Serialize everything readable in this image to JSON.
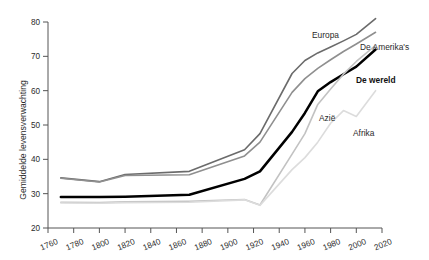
{
  "chart_data": {
    "type": "line",
    "title": "",
    "subtitle": "",
    "xlabel": "",
    "ylabel": "Gemiddelde levensverwachting",
    "xlim": [
      1760,
      2020
    ],
    "ylim": [
      20,
      80
    ],
    "xticks": [
      1760,
      1780,
      1800,
      1820,
      1840,
      1860,
      1880,
      1900,
      1920,
      1940,
      1960,
      1980,
      2000,
      2020
    ],
    "yticks": [
      20,
      30,
      40,
      50,
      60,
      70,
      80
    ],
    "grid": false,
    "legend_position": "inline-end-of-line",
    "x": [
      1770,
      1800,
      1820,
      1870,
      1913,
      1925,
      1950,
      1960,
      1970,
      1980,
      1990,
      2000,
      2015
    ],
    "series": [
      {
        "name": "Europa",
        "label": "Europa",
        "color": "#6b6b6b",
        "width": 1.6,
        "values": [
          34.6,
          33.5,
          35.6,
          36.5,
          42.8,
          47.5,
          65.0,
          68.8,
          71.0,
          72.7,
          74.5,
          76.4,
          81.0
        ]
      },
      {
        "name": "De Amerika's",
        "label": "De Amerika's",
        "color": "#8f8f8f",
        "width": 1.6,
        "values": [
          34.5,
          33.4,
          35.3,
          35.5,
          41.0,
          45.0,
          59.5,
          63.5,
          66.5,
          69.0,
          71.4,
          73.6,
          77.0
        ]
      },
      {
        "name": "De wereld",
        "label": "De wereld",
        "color": "#000000",
        "width": 2.5,
        "values": [
          29.0,
          29.0,
          29.1,
          29.7,
          34.3,
          36.5,
          48.0,
          53.5,
          59.8,
          62.5,
          64.8,
          67.0,
          72.0
        ]
      },
      {
        "name": "Azië",
        "label": "Azië",
        "color": "#c2c2c2",
        "width": 1.6,
        "values": [
          27.5,
          27.4,
          27.6,
          27.8,
          28.3,
          26.7,
          41.5,
          47.5,
          56.0,
          60.5,
          64.8,
          68.5,
          73.2
        ]
      },
      {
        "name": "Afrika",
        "label": "Afrika",
        "color": "#dcdcdc",
        "width": 1.6,
        "values": [
          27.3,
          27.2,
          27.4,
          27.5,
          28.2,
          26.6,
          37.0,
          40.5,
          45.0,
          50.5,
          54.2,
          52.5,
          60.0
        ]
      }
    ],
    "annotations": [
      {
        "text": "Europa",
        "series": "Europa"
      },
      {
        "text": "De Amerika's",
        "series": "De Amerika's"
      },
      {
        "text": "De wereld",
        "series": "De wereld"
      },
      {
        "text": "Azië",
        "series": "Azië"
      },
      {
        "text": "Afrika",
        "series": "Afrika"
      }
    ]
  },
  "labels": {
    "ylabel": "Gemiddelde levensverwachting",
    "europa": "Europa",
    "amerikas": "De Amerika's",
    "wereld": "De wereld",
    "azie": "Azië",
    "afrika": "Afrika"
  }
}
